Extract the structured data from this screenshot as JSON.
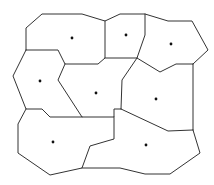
{
  "diagram": {
    "type": "voronoi",
    "width": 214,
    "height": 185,
    "stroke_color": "#333333",
    "site_color": "#111111",
    "background": "#ffffff",
    "sites": [
      {
        "id": "cell-top-left",
        "x": 72,
        "y": 38
      },
      {
        "id": "cell-top-middle",
        "x": 126,
        "y": 35
      },
      {
        "id": "cell-top-right",
        "x": 171,
        "y": 44
      },
      {
        "id": "cell-middle-left",
        "x": 40,
        "y": 81
      },
      {
        "id": "cell-center",
        "x": 96,
        "y": 93
      },
      {
        "id": "cell-middle-right",
        "x": 156,
        "y": 99
      },
      {
        "id": "cell-bottom-left",
        "x": 53,
        "y": 142
      },
      {
        "id": "cell-bottom-right",
        "x": 146,
        "y": 145
      }
    ],
    "edges": [
      "M26,50 L26,28 L42,14 L82,14 L105,21 L120,14 L145,14 L168,21 L192,21 L208,50 L193,64",
      "M26,50 L58,50 L65,64 L98,64 L105,58 L105,21",
      "M145,14 L145,35 L137,58",
      "M105,58 L137,58 L160,72 L176,64 L193,64",
      "M137,58 L122,80 L121,109",
      "M193,64 L193,130",
      "M26,50 L13,76 L26,109 L42,109 L50,117 L82,117",
      "M65,64 L58,80 L82,117 L114,117 L114,109 L121,109",
      "M121,109 L168,131 L193,130",
      "M26,109 L18,124 L18,153 L50,175 L82,168 L90,146 L107,141 L114,139 L114,117",
      "M82,168 L107,168 L120,168 L145,174 L170,174 L200,153 L193,130"
    ]
  }
}
